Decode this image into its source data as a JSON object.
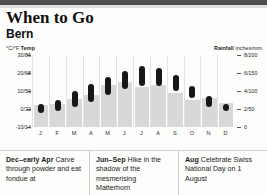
{
  "header": {
    "title": "When to Go",
    "subtitle": "Bern"
  },
  "legend": {
    "temp_unit": "°C/°F ",
    "temp_label": "Temp",
    "rain_label": "Rainfall",
    "rain_unit": " inches/mm"
  },
  "chart_data": {
    "type": "bar",
    "categories": [
      "J",
      "F",
      "M",
      "A",
      "M",
      "J",
      "J",
      "A",
      "S",
      "O",
      "N",
      "D"
    ],
    "xlabel": "",
    "ylabel": "°C/°F Temp",
    "y2label": "Rainfall inches/mm",
    "grid": true,
    "legend_position": "top",
    "y_left_ticks": [
      "30/86",
      "20/68",
      "10/50",
      "0/32",
      "-10/14"
    ],
    "y_left_values": [
      30,
      20,
      10,
      0,
      -10
    ],
    "ylim": [
      -10,
      30
    ],
    "y_right_ticks": [
      "8/200",
      "6/150",
      "4/100",
      "2/50",
      "0"
    ],
    "y_right_values": [
      8,
      6,
      4,
      2,
      0
    ],
    "y2lim": [
      0,
      8
    ],
    "series": [
      {
        "name": "Temperature range (°C)",
        "type": "range",
        "color": "#171717",
        "low": [
          -2,
          -1,
          1,
          4,
          8,
          11,
          13,
          13,
          10,
          6,
          1,
          -1
        ],
        "high": [
          3,
          5,
          10,
          14,
          18,
          21,
          24,
          23,
          19,
          13,
          7,
          3
        ]
      },
      {
        "name": "Rainfall (mm)",
        "type": "bar",
        "color": "#d8d8d8",
        "values": [
          62,
          65,
          78,
          88,
          116,
          124,
          112,
          117,
          95,
          75,
          80,
          68
        ]
      }
    ]
  },
  "tips": [
    {
      "season": "Dec–early Apr",
      "text": " Carve through powder and eat fondue at"
    },
    {
      "season": "Jun–Sep",
      "text": " Hike in the shadow of the mesmerising Matterhorn"
    },
    {
      "season": "Aug",
      "text": " Celebrate Swiss National Day on 1 August"
    }
  ]
}
